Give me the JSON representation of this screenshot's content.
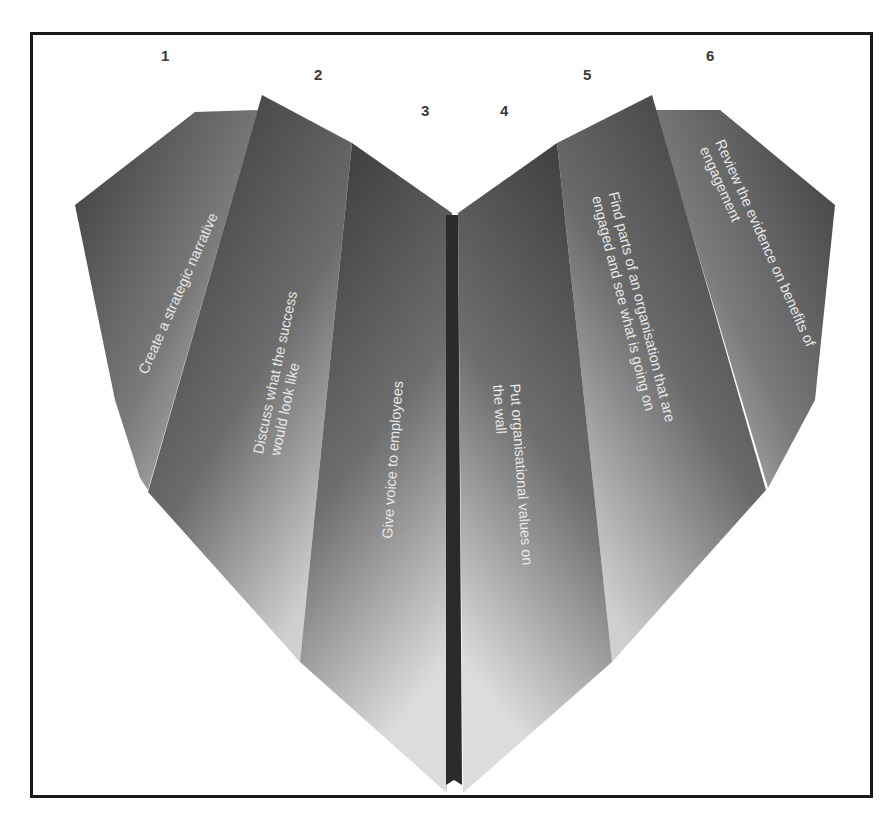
{
  "diagram": {
    "shape": "heart",
    "colors": {
      "dark": "#3a3a3a",
      "mid": "#6a6a6a",
      "light": "#d8d8d8",
      "text": "#e8e8e8",
      "number": "#3a3a3a",
      "border": "#1a1a1a",
      "spine": "#2b2b2b"
    },
    "panels": [
      {
        "number": "1",
        "label_lines": [
          "Create a strategic narrative"
        ]
      },
      {
        "number": "2",
        "label_lines": [
          "Discuss what the success",
          "would look like"
        ]
      },
      {
        "number": "3",
        "label_lines": [
          "Give voice to employees"
        ]
      },
      {
        "number": "4",
        "label_lines": [
          "Put organisational values on",
          "the wall"
        ]
      },
      {
        "number": "5",
        "label_lines": [
          "Find parts of an organisation that are",
          "engaged and see what is going on"
        ]
      },
      {
        "number": "6",
        "label_lines": [
          "Review the evidence on benefits of",
          "engagement"
        ]
      }
    ]
  }
}
